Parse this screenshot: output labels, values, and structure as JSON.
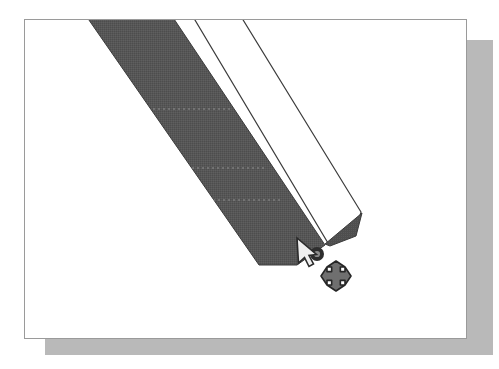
{
  "app": {
    "view_label": "drawing-canvas",
    "document_background": "#ffffff",
    "canvas_border_color": "#9a9a9a",
    "page_shadow_color": "#b9b9b9"
  },
  "canvas": {
    "page": {
      "x": 24,
      "y": 19,
      "width": 443,
      "height": 320
    },
    "shadow": {
      "x": 45,
      "y": 40,
      "width": 448,
      "height": 315
    }
  },
  "shapes": [
    {
      "name": "filled-ribbon-shape",
      "fill": "#565656",
      "stroke": "#3a3a3a",
      "stroke_width": 1,
      "points": "57,-10 143,-10 300,225 272,245 234,245"
    },
    {
      "name": "outlined-ribbon-shape",
      "fill": "#ffffff",
      "stroke": "#3c3c3c",
      "stroke_width": 1.2,
      "points": "164,-10 212,-10 336,192 330,215 303,223"
    },
    {
      "name": "shape-joint-wedge",
      "fill": "#4e4e4e",
      "stroke": "#3a3a3a",
      "stroke_width": 1,
      "points": "300,224 337,193 331,216 305,226"
    }
  ],
  "guides": [
    {
      "name": "guide-line-upper",
      "x1": 103,
      "y1": 89,
      "x2": 205,
      "y2": 89,
      "color": "#8e8e8e"
    },
    {
      "name": "guide-line-middle",
      "x1": 137,
      "y1": 148,
      "x2": 240,
      "y2": 148,
      "color": "#8e8e8e"
    },
    {
      "name": "guide-line-lower",
      "x1": 158,
      "y1": 180,
      "x2": 258,
      "y2": 180,
      "color": "#8e8e8e"
    }
  ],
  "selection": {
    "handle": {
      "name": "vertex-handle",
      "x": 292,
      "y": 234,
      "outer_radius": 7,
      "inner_radius": 3.1,
      "outer_color": "#2e2e2e",
      "inner_color": "#8d8d8d"
    }
  },
  "cursor": {
    "pointer": {
      "name": "arrow-pointer-cursor",
      "tip_x": 297,
      "tip_y": 238,
      "fill": "#efefef",
      "stroke": "#2b2b2b"
    },
    "move_badge": {
      "name": "move-four-way-icon",
      "center_x": 336,
      "center_y": 276,
      "size": 30,
      "fill": "#6f6f6f",
      "stroke": "#262626"
    }
  }
}
